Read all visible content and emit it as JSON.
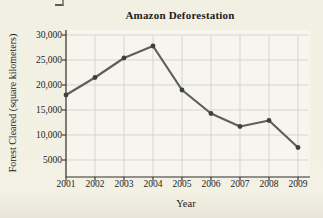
{
  "figure": {
    "background_color": "#f2efe3",
    "plot_background_color": "#f6f5ee"
  },
  "chart_data": {
    "type": "line",
    "title": "Amazon Deforestation",
    "xlabel": "Year",
    "ylabel": "Forest Cleared (square kilometers)",
    "categories": [
      "2001",
      "2002",
      "2003",
      "2004",
      "2005",
      "2006",
      "2007",
      "2008",
      "2009"
    ],
    "values": [
      18000,
      21500,
      25400,
      27800,
      19000,
      14300,
      11700,
      12900,
      7500
    ],
    "ylim": [
      0,
      30000
    ],
    "ytick_interval": 5000,
    "ytick_labels_top_to_bottom": [
      "30,000",
      "25,000",
      "20,000",
      "15,000",
      "10,000",
      "5000"
    ],
    "grid": true,
    "legend": "none",
    "line_color": "#5f5f5f",
    "marker_color": "#3f3f3f",
    "grid_color": "#d6d5cd",
    "axis_color": "#2f2f2f"
  }
}
